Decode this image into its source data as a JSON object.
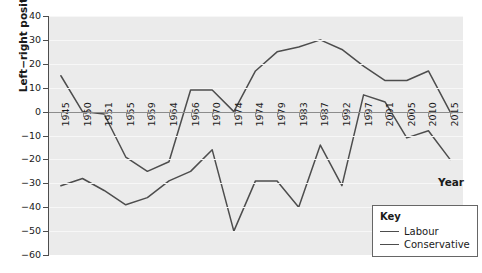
{
  "chart_data": {
    "type": "line",
    "title": "",
    "xlabel": "Year",
    "ylabel": "Left−right position",
    "ylim": [
      -60,
      40
    ],
    "xlim": [
      0,
      20
    ],
    "grid": true,
    "legend_position": "bottom-right",
    "legend_title": "Key",
    "categories": [
      "1945",
      "1950",
      "1951",
      "1955",
      "1959",
      "1964",
      "1966",
      "1970",
      "1974",
      "1974",
      "1979",
      "1983",
      "1987",
      "1992",
      "1997",
      "2001",
      "2005",
      "2010",
      "2015"
    ],
    "yticks": [
      40,
      30,
      20,
      10,
      0,
      -10,
      -20,
      -30,
      -40,
      -50,
      -60
    ],
    "ytick_labels": [
      "40",
      "30",
      "20",
      "10",
      "0",
      "−10",
      "−20",
      "−30",
      "−40",
      "−50",
      "−60"
    ],
    "series": [
      {
        "name": "Labour",
        "color": "#4d4d4d",
        "values": [
          -31,
          -28,
          -33,
          -39,
          -36,
          -29,
          -25,
          -16,
          -50,
          -29,
          -29,
          -40,
          -14,
          -31,
          7,
          4,
          -11,
          -8,
          -20
        ]
      },
      {
        "name": "Conservative",
        "color": "#4d4d4d",
        "values": [
          15,
          0,
          -1,
          -19,
          -25,
          -21,
          9,
          9,
          0,
          17,
          25,
          27,
          30,
          26,
          19,
          13,
          13,
          17,
          0
        ]
      }
    ]
  },
  "legend": {
    "title": "Key",
    "items": [
      {
        "label": "Labour"
      },
      {
        "label": "Conservative"
      }
    ]
  },
  "axes": {
    "y_title": "Left−right position",
    "x_title": "Year"
  },
  "colors": {
    "plot_background": "#ebebeb",
    "gridline": "#f7f7f7",
    "line": "#4d4d4d",
    "axis": "#4d4d4d",
    "text": "#1a1a1a"
  }
}
